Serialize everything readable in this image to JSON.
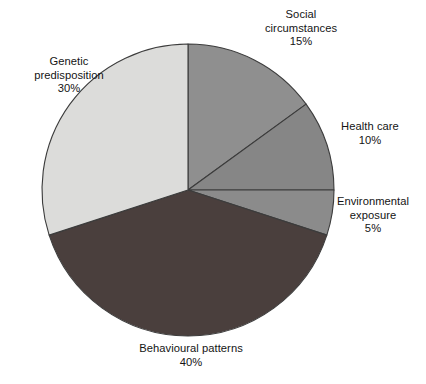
{
  "chart_data": {
    "type": "pie",
    "title": "",
    "subtitle": "",
    "xlabel": "",
    "ylabel": "",
    "legend_position": "none",
    "grid": false,
    "start_angle_deg": 0,
    "direction": "clockwise",
    "unit": "%",
    "categories": [
      "Social circumstances",
      "Health care",
      "Environmental exposure",
      "Behavioural patterns",
      "Genetic predisposition"
    ],
    "values": [
      15,
      10,
      5,
      40,
      30
    ],
    "labels": [
      "Social circumstances 15%",
      "Health care 10%",
      "Environmental exposure 5%",
      "Behavioural patterns 40%",
      "Genetic predisposition 30%"
    ],
    "colors": [
      "#8f8f8f",
      "#868686",
      "#8b8b8b",
      "#4a3f3d",
      "#dcdcda"
    ],
    "slices": [
      {
        "name": "Social circumstances",
        "name_line1": "Social",
        "name_line2": "circumstances",
        "value": 15,
        "value_label": "15%",
        "color": "#8f8f8f",
        "start_deg": 0,
        "end_deg": 54
      },
      {
        "name": "Health care",
        "name_line1": "Health care",
        "name_line2": "",
        "value": 10,
        "value_label": "10%",
        "color": "#868686",
        "start_deg": 54,
        "end_deg": 90
      },
      {
        "name": "Environmental exposure",
        "name_line1": "Environmental",
        "name_line2": "exposure",
        "value": 5,
        "value_label": "5%",
        "color": "#8b8b8b",
        "start_deg": 90,
        "end_deg": 108
      },
      {
        "name": "Behavioural patterns",
        "name_line1": "Behavioural patterns",
        "name_line2": "",
        "value": 40,
        "value_label": "40%",
        "color": "#4a3f3d",
        "start_deg": 108,
        "end_deg": 252
      },
      {
        "name": "Genetic predisposition",
        "name_line1": "Genetic",
        "name_line2": "predisposition",
        "value": 30,
        "value_label": "30%",
        "color": "#dcdcda",
        "start_deg": 252,
        "end_deg": 360
      }
    ]
  },
  "figure": {
    "background_color": "#ffffff",
    "outline_color": "#3c3c3c",
    "center_x": 188,
    "center_y": 190,
    "radius": 146
  }
}
